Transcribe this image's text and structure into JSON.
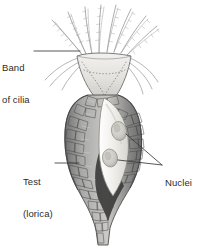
{
  "figure": {
    "background_color": "#ffffff",
    "ink_color": "#2b2b2b",
    "style": "grayscale pen-and-ink scientific illustration"
  },
  "labels": [
    {
      "id": "band-of-cilia",
      "line1": "Band",
      "line2": "of cilia",
      "text": "Band of cilia",
      "position": "upper-left",
      "leader": "horizontal line from label to rim of ciliary bell"
    },
    {
      "id": "test-lorica",
      "line1": "Test",
      "line2": "(lorica)",
      "text": "Test (lorica)",
      "position": "lower-left",
      "leader": "horizontal line from label to pebbled test wall"
    },
    {
      "id": "nuclei",
      "line1": "Nuclei",
      "text": "Nuclei",
      "position": "right",
      "leader": "two branching lines to the two oval nuclei"
    }
  ],
  "structures": {
    "cilia": {
      "name": "band of cilia",
      "description": "feathery ciliary tufts radiating upward and outward from the bell rim",
      "count": 16,
      "color": "#7a7a7a"
    },
    "bell": {
      "name": "ciliary bell / peristome",
      "description": "pale funnel-shaped oral region narrowing downward, marked with dotted membranelle rows",
      "fill": "#e3e2df"
    },
    "test": {
      "name": "test (lorica)",
      "description": "flask-shaped wall built of irregular agglutinated pebble-like plates, tapering to a basal stalk",
      "fill": "#9a9a9a"
    },
    "cell_body": {
      "name": "cell body",
      "description": "pale elongate protoplasm suspended inside the lorica",
      "fill": "#efeeea"
    },
    "nuclei": {
      "name": "nuclei",
      "count": 2,
      "description": "two oval nuclei within the cell body",
      "fill": "#cfcdc8"
    },
    "shadow": {
      "name": "interior shadow",
      "description": "dark cavity shading at base of lorica interior",
      "fill": "#3a3a3a"
    }
  }
}
